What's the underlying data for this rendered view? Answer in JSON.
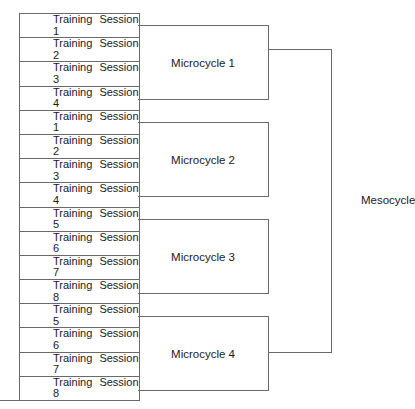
{
  "diagram": {
    "type": "hierarchy-bracket",
    "sessions": [
      {
        "label": "Training Session",
        "number": "1"
      },
      {
        "label": "Training Session",
        "number": "2"
      },
      {
        "label": "Training Session",
        "number": "3"
      },
      {
        "label": "Training Session",
        "number": "4"
      },
      {
        "label": "Training Session",
        "number": "1"
      },
      {
        "label": "Training Session",
        "number": "2"
      },
      {
        "label": "Training Session",
        "number": "3"
      },
      {
        "label": "Training Session",
        "number": "4"
      },
      {
        "label": "Training Session",
        "number": "5"
      },
      {
        "label": "Training Session",
        "number": "6"
      },
      {
        "label": "Training Session",
        "number": "7"
      },
      {
        "label": "Training Session",
        "number": "8"
      },
      {
        "label": "Training Session",
        "number": "5"
      },
      {
        "label": "Training Session",
        "number": "6"
      },
      {
        "label": "Training Session",
        "number": "7"
      },
      {
        "label": "Training Session",
        "number": "8"
      }
    ],
    "microcycles": [
      {
        "label": "Microcycle 1"
      },
      {
        "label": "Microcycle 2"
      },
      {
        "label": "Microcycle 3"
      },
      {
        "label": "Microcycle 4"
      }
    ],
    "mesocycle": {
      "label": "Mesocycle"
    },
    "line_color": "#6a6a6a"
  }
}
